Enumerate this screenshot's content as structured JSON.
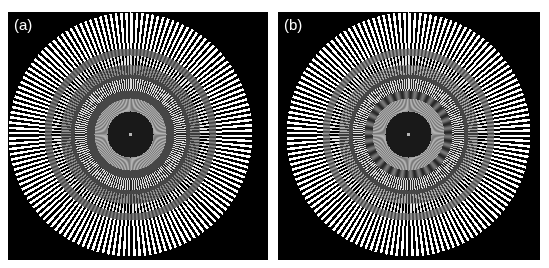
{
  "figure": {
    "panels": [
      {
        "id": "a",
        "label": "(a)",
        "description": "Siemens star test pattern, reconstruction with moderate aliasing"
      },
      {
        "id": "b",
        "label": "(b)",
        "description": "Siemens star test pattern, reconstruction with stronger aliasing/moire"
      }
    ],
    "colors": {
      "background": "#000000",
      "spokes": "#ffffff",
      "border": "#ffffff",
      "gray_band": "#7a7a7a"
    },
    "pattern": {
      "spokes": 144,
      "outer_radius_px": 122
    }
  }
}
